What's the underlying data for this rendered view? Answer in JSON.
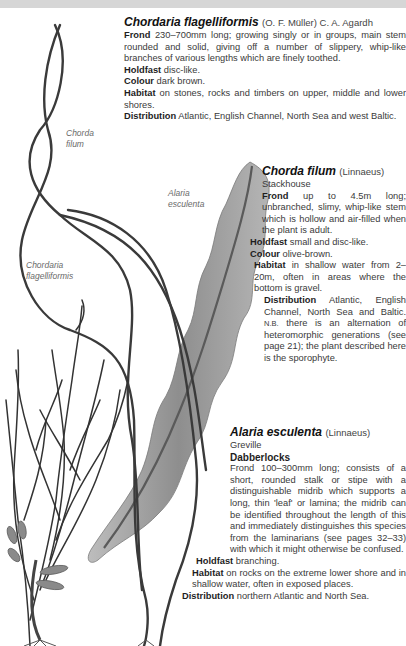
{
  "page": {
    "running_head": "WHAT SEAWEED?"
  },
  "illustration": {
    "labels": {
      "chorda_filum_line1": "Chorda",
      "chorda_filum_line2": "filum",
      "chordaria_line1": "Chordaria",
      "chordaria_line2": "flagelliformis",
      "alaria_line1": "Alaria",
      "alaria_line2": "esculenta"
    },
    "colors": {
      "stem": "#3a3a3a",
      "lamina": "#9a9a9a",
      "lamina_light": "#c8c8c8",
      "header_bar": "#d6d6d6"
    }
  },
  "entries": {
    "chordaria": {
      "name": "Chordaria flagelliformis",
      "authority": "(O. F. Müller) C. A. Agardh",
      "frond_label": "Frond",
      "frond_text": "230–700mm long; growing singly or in groups, main stem rounded and solid, giving off a number of slippery, whip-like branches of various lengths which are finely toothed.",
      "holdfast_label": "Holdfast",
      "holdfast_text": "disc-like.",
      "colour_label": "Colour",
      "colour_text": "dark brown.",
      "habitat_label": "Habitat",
      "habitat_text": "on stones, rocks and timbers on upper, middle and lower shores.",
      "distribution_label": "Distribution",
      "distribution_text": "Atlantic, English Channel, North Sea and west Baltic."
    },
    "chorda": {
      "name": "Chorda filum",
      "authority_1": "(Linnaeus)",
      "authority_2": "Stackhouse",
      "frond_label": "Frond",
      "frond_text": "up to 4.5m long; unbranched, slimy, whip-like stem which is hollow and air-filled when the plant is adult.",
      "holdfast_label": "Holdfast",
      "holdfast_text": "small and disc-like.",
      "colour_label": "Colour",
      "colour_text": "olive-brown.",
      "habitat_label": "Habitat",
      "habitat_text": "in shallow water from 2–20m, often in areas where the bottom is gravel.",
      "distribution_label": "Distribution",
      "distribution_text": "Atlantic, English Channel, North Sea and Baltic.",
      "nb_label": "N.B.",
      "nb_text": "there is an alternation of heteromorphic generations (see page 21); the plant described here is the sporophyte."
    },
    "alaria": {
      "name": "Alaria esculenta",
      "authority_1": "(Linnaeus)",
      "authority_2": "Greville",
      "common_name": "Dabberlocks",
      "frond_text": "Frond 100–300mm long; consists of a short, rounded stalk or stipe with a distinguishable midrib which supports a long, thin 'leaf' or lamina; the midrib can be identified throughout the length of this and immediately distinguishes this species from the laminarians (see pages 32–33) with which it might otherwise be confused.",
      "holdfast_label": "Holdfast",
      "holdfast_text": "branching.",
      "habitat_label": "Habitat",
      "habitat_text": "on rocks on the extreme lower shore and in shallow water, often in exposed places.",
      "distribution_label": "Distribution",
      "distribution_text": "northern Atlantic and North Sea."
    }
  }
}
